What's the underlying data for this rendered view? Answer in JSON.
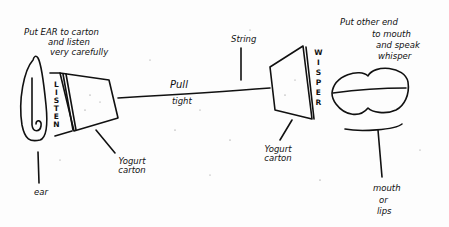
{
  "diagram": {
    "labels": {
      "ear_instruction_line1": "Put EAR to carton",
      "ear_instruction_line2": "and   listen",
      "ear_instruction_line3": "very   carefully",
      "listen_vertical": "LISTEN",
      "string": "String",
      "pull": "Pull",
      "tight": "tight",
      "whisper_vertical": "WISPER",
      "mouth_instruction_line1": "Put other end",
      "mouth_instruction_line2": "to mouth",
      "mouth_instruction_line3": "and speak",
      "mouth_instruction_line4": "whisper",
      "left_carton": "Yogurt carton",
      "right_carton": "Yogurt carton",
      "ear": "ear",
      "mouth_line1": "mouth",
      "mouth_line2": "or",
      "mouth_line3": "lips"
    },
    "colors": {
      "ink": "#111111",
      "paper": "#fdfdfd"
    }
  }
}
